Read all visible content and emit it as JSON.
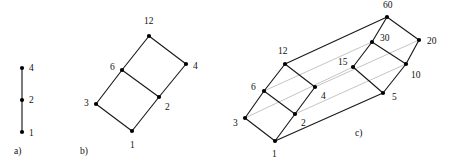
{
  "figure": {
    "background_color": "#ffffff",
    "edge_color_dark": "#1a1a1a",
    "edge_color_light": "#b9b9b9",
    "node_color": "#000000",
    "width": 451,
    "height": 163
  },
  "panels": [
    {
      "id": "a",
      "caption": "a)",
      "caption_pos": [
        14,
        152
      ],
      "description": "divisor lattice of 4 (chain)",
      "nodes": [
        {
          "label": "1",
          "x": 22,
          "y": 132,
          "lx": 29,
          "ly": 134
        },
        {
          "label": "2",
          "x": 22,
          "y": 100,
          "lx": 29,
          "ly": 101
        },
        {
          "label": "4",
          "x": 22,
          "y": 68,
          "lx": 29,
          "ly": 69
        }
      ],
      "edges": [
        {
          "from": "1",
          "to": "2",
          "style": "dark"
        },
        {
          "from": "2",
          "to": "4",
          "style": "dark"
        }
      ]
    },
    {
      "id": "b",
      "caption": "b)",
      "caption_pos": [
        80,
        152
      ],
      "description": "divisor lattice of 12",
      "nodes": [
        {
          "label": "1",
          "x": 132,
          "y": 131,
          "lx": 130,
          "ly": 146
        },
        {
          "label": "2",
          "x": 159,
          "y": 97,
          "lx": 165,
          "ly": 108
        },
        {
          "label": "3",
          "x": 96,
          "y": 104,
          "lx": 84,
          "ly": 104
        },
        {
          "label": "4",
          "x": 186,
          "y": 64,
          "lx": 193,
          "ly": 67
        },
        {
          "label": "6",
          "x": 122,
          "y": 70,
          "lx": 110,
          "ly": 68
        },
        {
          "label": "12",
          "x": 149,
          "y": 36,
          "lx": 144,
          "ly": 22
        }
      ],
      "edges": [
        {
          "from": "1",
          "to": "2",
          "style": "dark"
        },
        {
          "from": "1",
          "to": "3",
          "style": "dark"
        },
        {
          "from": "2",
          "to": "4",
          "style": "dark"
        },
        {
          "from": "2",
          "to": "6",
          "style": "dark"
        },
        {
          "from": "3",
          "to": "6",
          "style": "dark"
        },
        {
          "from": "6",
          "to": "12",
          "style": "dark"
        },
        {
          "from": "4",
          "to": "12",
          "style": "dark"
        }
      ]
    },
    {
      "id": "c",
      "caption": "c)",
      "caption_pos": [
        355,
        134
      ],
      "description": "divisor lattice of 60",
      "nodes": [
        {
          "label": "1",
          "x": 275,
          "y": 141,
          "lx": 272,
          "ly": 155
        },
        {
          "label": "2",
          "x": 295,
          "y": 114,
          "lx": 301,
          "ly": 124
        },
        {
          "label": "3",
          "x": 245,
          "y": 118,
          "lx": 233,
          "ly": 124
        },
        {
          "label": "4",
          "x": 315,
          "y": 87,
          "lx": 321,
          "ly": 97
        },
        {
          "label": "5",
          "x": 383,
          "y": 93,
          "lx": 392,
          "ly": 98
        },
        {
          "label": "6",
          "x": 264,
          "y": 91,
          "lx": 251,
          "ly": 88
        },
        {
          "label": "10",
          "x": 406,
          "y": 64,
          "lx": 411,
          "ly": 76
        },
        {
          "label": "12",
          "x": 285,
          "y": 64,
          "lx": 278,
          "ly": 52
        },
        {
          "label": "15",
          "x": 353,
          "y": 67,
          "lx": 338,
          "ly": 63
        },
        {
          "label": "20",
          "x": 419,
          "y": 40,
          "lx": 427,
          "ly": 42
        },
        {
          "label": "30",
          "x": 372,
          "y": 42,
          "lx": 380,
          "ly": 39
        },
        {
          "label": "60",
          "x": 387,
          "y": 17,
          "lx": 383,
          "ly": 6
        }
      ],
      "edges": [
        {
          "from": "1",
          "to": "2",
          "style": "dark"
        },
        {
          "from": "1",
          "to": "3",
          "style": "dark"
        },
        {
          "from": "1",
          "to": "5",
          "style": "dark"
        },
        {
          "from": "2",
          "to": "4",
          "style": "dark"
        },
        {
          "from": "2",
          "to": "6",
          "style": "dark"
        },
        {
          "from": "2",
          "to": "10",
          "style": "light"
        },
        {
          "from": "3",
          "to": "6",
          "style": "dark"
        },
        {
          "from": "3",
          "to": "15",
          "style": "light"
        },
        {
          "from": "4",
          "to": "12",
          "style": "dark"
        },
        {
          "from": "4",
          "to": "20",
          "style": "light"
        },
        {
          "from": "5",
          "to": "10",
          "style": "dark"
        },
        {
          "from": "5",
          "to": "15",
          "style": "dark"
        },
        {
          "from": "6",
          "to": "12",
          "style": "dark"
        },
        {
          "from": "6",
          "to": "30",
          "style": "light"
        },
        {
          "from": "10",
          "to": "20",
          "style": "dark"
        },
        {
          "from": "10",
          "to": "30",
          "style": "dark"
        },
        {
          "from": "12",
          "to": "60",
          "style": "dark"
        },
        {
          "from": "15",
          "to": "30",
          "style": "dark"
        },
        {
          "from": "20",
          "to": "60",
          "style": "dark"
        },
        {
          "from": "30",
          "to": "60",
          "style": "dark"
        }
      ]
    }
  ]
}
